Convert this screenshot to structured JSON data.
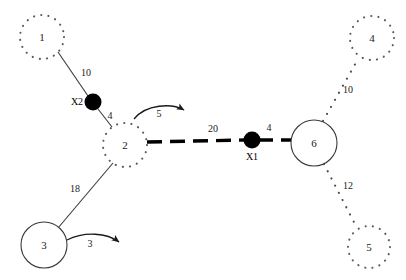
{
  "diagram": {
    "nodes": [
      {
        "id": "n1",
        "label": "1",
        "style": "dotted",
        "cx": 42,
        "cy": 37,
        "r": 22
      },
      {
        "id": "n2",
        "label": "2",
        "style": "dotted",
        "cx": 125,
        "cy": 145,
        "r": 22
      },
      {
        "id": "n3",
        "label": "3",
        "style": "solid",
        "cx": 44,
        "cy": 245,
        "r": 23
      },
      {
        "id": "n4",
        "label": "4",
        "style": "dotted",
        "cx": 372,
        "cy": 38,
        "r": 22
      },
      {
        "id": "n5",
        "label": "5",
        "style": "dotted",
        "cx": 369,
        "cy": 247,
        "r": 21
      },
      {
        "id": "n6",
        "label": "6",
        "style": "solid",
        "cx": 314,
        "cy": 143,
        "r": 23
      }
    ],
    "factors": [
      {
        "id": "x2",
        "label": "X2",
        "cx": 93,
        "cy": 102,
        "r": 8,
        "label_x": 77,
        "label_y": 105
      },
      {
        "id": "x1",
        "label": "X1",
        "cx": 252,
        "cy": 140,
        "r": 8,
        "label_x": 252,
        "label_y": 159
      }
    ],
    "edges": [
      {
        "id": "e-n1-x2",
        "weight": "10",
        "style": "solid",
        "label_x": 86,
        "label_y": 76
      },
      {
        "id": "e-x2-n2",
        "weight": "4",
        "style": "solid",
        "label_x": 110,
        "label_y": 119
      },
      {
        "id": "e-n2-x1",
        "weight": "20",
        "style": "dashed-thick",
        "label_x": 213,
        "label_y": 132
      },
      {
        "id": "e-x1-n6",
        "weight": "4",
        "style": "solid",
        "label_x": 269,
        "label_y": 131
      },
      {
        "id": "e-n6-n4",
        "weight": "10",
        "style": "dotted",
        "label_x": 348,
        "label_y": 93
      },
      {
        "id": "e-n6-n5",
        "weight": "12",
        "style": "dotted",
        "label_x": 348,
        "label_y": 189
      },
      {
        "id": "e-n3-n2",
        "weight": "18",
        "style": "solid",
        "label_x": 75,
        "label_y": 192
      },
      {
        "id": "e-n2-loop",
        "weight": "5",
        "style": "arrow",
        "label_x": 159,
        "label_y": 117
      },
      {
        "id": "e-n3-loop",
        "weight": "3",
        "style": "arrow",
        "label_x": 90,
        "label_y": 247
      }
    ],
    "colors": {
      "node_stroke": "#3a3a3a",
      "dotted_stroke": "#5a5a5a",
      "factor_fill": "#000000",
      "background": "#ffffff"
    }
  }
}
